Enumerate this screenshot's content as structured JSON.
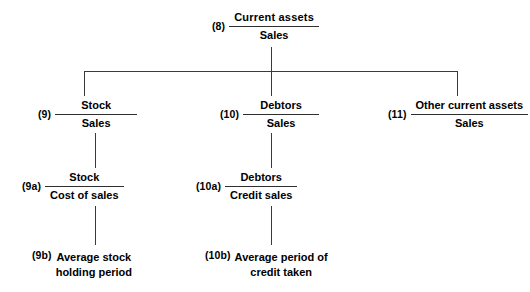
{
  "diagram": {
    "background_color": "#ffffff",
    "line_color": "#3a3a3a",
    "text_color": "#000000",
    "nodes": [
      {
        "id": "n8",
        "ref": "(8)",
        "numerator": "Current  assets",
        "denominator": "Sales"
      },
      {
        "id": "n9",
        "ref": "(9)",
        "numerator": "Stock",
        "denominator": "Sales"
      },
      {
        "id": "n10",
        "ref": "(10)",
        "numerator": "Debtors",
        "denominator": "Sales"
      },
      {
        "id": "n11",
        "ref": "(11)",
        "numerator": "Other current assets",
        "denominator": "Sales"
      },
      {
        "id": "n9a",
        "ref": "(9a)",
        "numerator": "Stock",
        "denominator": "Cost of sales"
      },
      {
        "id": "n10a",
        "ref": "(10a)",
        "numerator": "Debtors",
        "denominator": "Credit sales"
      }
    ],
    "leaves": [
      {
        "id": "n9b",
        "ref": "(9b)",
        "line1": "Average stock",
        "line2": "holding period"
      },
      {
        "id": "n10b",
        "ref": "(10b)",
        "line1": "Average period of",
        "line2": "credit taken"
      }
    ]
  }
}
